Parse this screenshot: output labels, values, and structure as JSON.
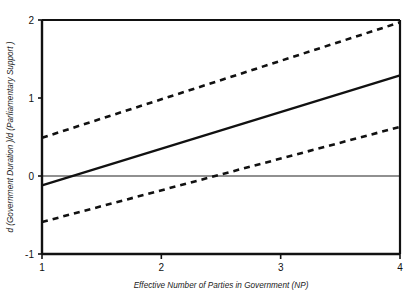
{
  "chart_data": {
    "type": "line",
    "title": "",
    "xlabel": "Effective Number of Parties in Government  (NP)",
    "ylabel": "d (Government Duration )/d (Parliamentary Support )",
    "xlim": [
      1,
      4
    ],
    "ylim": [
      -1,
      2
    ],
    "xticks": [
      1,
      2,
      3,
      4
    ],
    "xticklabels": [
      "1",
      "2",
      "3",
      "4"
    ],
    "yticks": [
      -1,
      0,
      1,
      2
    ],
    "yticklabels": [
      "-1",
      "0",
      "1",
      "2"
    ],
    "grid": false,
    "legend": null,
    "zero_reference_line": 0,
    "series": [
      {
        "name": "Upper 95% confidence bound",
        "style": "dashed",
        "color": "#111111",
        "x": [
          1,
          4
        ],
        "values": [
          0.49,
          1.97
        ]
      },
      {
        "name": "Marginal effect estimate",
        "style": "solid",
        "color": "#111111",
        "x": [
          1,
          4
        ],
        "values": [
          -0.12,
          1.29
        ]
      },
      {
        "name": "Lower 95% confidence bound",
        "style": "dashed",
        "color": "#111111",
        "x": [
          1,
          4
        ],
        "values": [
          -0.59,
          0.63
        ]
      }
    ],
    "annotations": []
  },
  "figure": {
    "background_color": "#ffffff",
    "axis_color": "#111111",
    "zero_line_color": "#6b6b6b"
  }
}
